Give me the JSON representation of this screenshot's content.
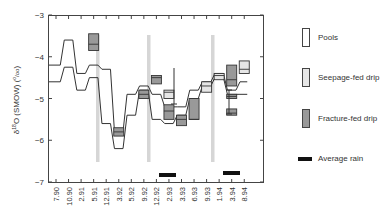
{
  "chart_data": {
    "type": "line",
    "title": "",
    "xlabel": "",
    "ylabel": "δ18O (SMOW) (‰)",
    "ylabel_parts": {
      "delta": "δ",
      "sup": "18",
      "rest": "O (SMOW) (",
      "unit_sup": "o",
      "unit_sub": "/oo",
      "close": ")"
    },
    "ylim": [
      -7,
      -3
    ],
    "yticks": [
      "-3",
      "-4",
      "-5",
      "-6",
      "-7"
    ],
    "categories": [
      "7.90",
      "10.90",
      "2.91",
      "5.91",
      "12.91",
      "3.92",
      "5.92",
      "9.92",
      "12.92",
      "2.93",
      "3.93",
      "6.93",
      "9.93",
      "1.94",
      "3.94",
      "8.94"
    ],
    "series": [
      {
        "name": "Pools (upper bound)",
        "values": [
          -4.2,
          -3.6,
          -4.4,
          -4.2,
          -4.3,
          -5.8,
          -4.9,
          -4.7,
          -4.9,
          -5.2,
          -5.2,
          -4.8,
          -4.6,
          -4.4,
          -4.8,
          -4.6
        ]
      },
      {
        "name": "Pools (lower bound)",
        "values": [
          -4.6,
          -4.25,
          -4.8,
          -4.5,
          -5.6,
          -6.2,
          -5.4,
          -4.8,
          -5.5,
          -5.6,
          -5.4,
          -5.0,
          -4.7,
          -4.5,
          -4.9,
          -4.9
        ]
      }
    ],
    "boxes": [
      {
        "type": "Fracture-fed drip",
        "x": "5.91",
        "min": -3.85,
        "median": -3.7,
        "max": -3.45
      },
      {
        "type": "Fracture-fed drip",
        "x": "3.92",
        "min": -5.9,
        "median": -5.8,
        "max": -5.7
      },
      {
        "type": "Fracture-fed drip",
        "x": "9.92",
        "min": -5.0,
        "median": -4.9,
        "max": -4.8
      },
      {
        "type": "Fracture-fed drip",
        "x": "12.92",
        "min": -4.65,
        "median": -4.5,
        "max": -4.45
      },
      {
        "type": "Seepage-fed drip",
        "x": "2.93",
        "min": -5.0,
        "median": -4.85,
        "max": -4.8
      },
      {
        "type": "Fracture-fed drip",
        "x": "2.93",
        "min": -5.5,
        "median": -5.3,
        "max": -5.15
      },
      {
        "type": "Fracture-fed drip",
        "x": "3.93",
        "min": -5.65,
        "median": -5.5,
        "max": -5.4
      },
      {
        "type": "Fracture-fed drip",
        "x": "6.93",
        "min": -5.5,
        "median": -5.5,
        "max": -5.0
      },
      {
        "type": "Seepage-fed drip",
        "x": "9.93",
        "min": -4.85,
        "median": -4.7,
        "max": -4.6
      },
      {
        "type": "Seepage-fed drip",
        "x": "1.94",
        "min": -4.55,
        "median": -4.45,
        "max": -4.4
      },
      {
        "type": "Fracture-fed drip",
        "x": "3.94",
        "min": -4.7,
        "median": -4.55,
        "max": -4.2
      },
      {
        "type": "Fracture-fed drip",
        "x": "3.94b",
        "min": -5.0,
        "median": -4.95,
        "max": -4.9
      },
      {
        "type": "Fracture-fed drip",
        "x": "3.94c",
        "min": -5.4,
        "median": -5.35,
        "max": -5.25
      },
      {
        "type": "Seepage-fed drip",
        "x": "8.94",
        "min": -4.4,
        "median": -4.3,
        "max": -4.1
      }
    ],
    "rain_periods": [
      {
        "x_from": "12.92",
        "x_to": "2.93"
      },
      {
        "x_from": "1.94",
        "x_to": "3.94"
      }
    ],
    "vertical_bands": [
      "5.91",
      "12.92",
      "9.93"
    ],
    "legend": [
      "Pools",
      "Seepage-fed drip",
      "Fracture-fed drip",
      "Average rain"
    ],
    "legend_position": "right",
    "grid": false
  },
  "legend": {
    "pools": "Pools",
    "seepage": "Seepage-fed drip",
    "fracture": "Fracture-fed drip",
    "rain": "Average rain"
  },
  "colors": {
    "pools": "#ffffff",
    "seepage": "#e6e6e6",
    "fracture": "#999999",
    "rain": "#111111",
    "band": "#d6d6d6",
    "line": "#333333"
  }
}
